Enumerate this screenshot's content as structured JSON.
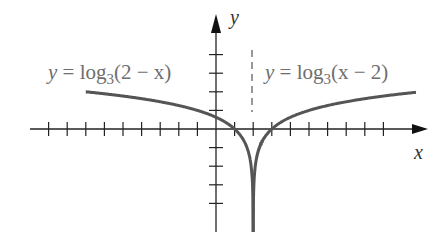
{
  "figure": {
    "type": "function-graph",
    "axes": {
      "x_label": "x",
      "y_label": "y",
      "origin_px": [
        216,
        129
      ],
      "unit_px": 18.6,
      "x_ticks_left": 9,
      "x_ticks_right": 9,
      "y_ticks_up": 4,
      "y_ticks_down": 4
    },
    "asymptote": {
      "x": 2,
      "style": "dashed"
    },
    "curves": [
      {
        "id": "left",
        "equation_prefix": "y = log",
        "base": "3",
        "argument": "(2 − x)",
        "domain": "x < 2"
      },
      {
        "id": "right",
        "equation_prefix": "y = log",
        "base": "3",
        "argument": "(x − 2)",
        "domain": "x > 2"
      }
    ],
    "colors": {
      "curve": "#555555",
      "axis": "#222222",
      "label": "#6e6e6e"
    }
  }
}
